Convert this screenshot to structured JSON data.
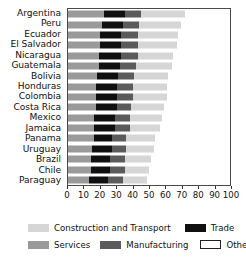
{
  "chart_data": {
    "type": "bar",
    "orientation": "horizontal",
    "stacked": true,
    "title": "",
    "xlabel": "",
    "ylabel": "",
    "xlim": [
      0,
      100
    ],
    "xticks": [
      0,
      10,
      20,
      30,
      40,
      50,
      60,
      70,
      80,
      90,
      100
    ],
    "grid": false,
    "legend_position": "bottom",
    "categories": [
      "Argentina",
      "Peru",
      "Ecuador",
      "El Salvador",
      "Nicaragua",
      "Guatemala",
      "Bolivia",
      "Honduras",
      "Colombia",
      "Costa Rica",
      "Mexico",
      "Jamaica",
      "Panama",
      "Uruguay",
      "Brazil",
      "Chile",
      "Paraguay"
    ],
    "series": [
      {
        "name": "Services",
        "color": "#9a9a9a",
        "values": [
          22,
          21,
          20,
          20,
          19,
          19,
          18,
          17,
          17,
          17,
          16,
          16,
          16,
          15,
          14,
          14,
          13
        ]
      },
      {
        "name": "Trade",
        "color": "#101010",
        "values": [
          13,
          13,
          13,
          13,
          14,
          13,
          13,
          13,
          13,
          13,
          13,
          13,
          11,
          12,
          12,
          12,
          12
        ]
      },
      {
        "name": "Manufacturing",
        "color": "#5b5b5b",
        "values": [
          10,
          10,
          10,
          10,
          10,
          10,
          10,
          10,
          10,
          9,
          9,
          9,
          9,
          9,
          9,
          9,
          9
        ]
      },
      {
        "name": "Construction and Transport",
        "color": "#d6d6d6",
        "values": [
          27,
          26,
          25,
          24,
          22,
          22,
          21,
          21,
          21,
          20,
          20,
          19,
          18,
          17,
          16,
          15,
          15
        ]
      },
      {
        "name": "Others",
        "color": "#ffffff",
        "values": [
          28,
          30,
          32,
          33,
          35,
          36,
          38,
          39,
          39,
          41,
          42,
          43,
          46,
          47,
          49,
          50,
          51
        ]
      }
    ],
    "totals": [
      72,
      70,
      68,
      67,
      65,
      64,
      62,
      61,
      61,
      59,
      58,
      57,
      54,
      53,
      51,
      50,
      49
    ]
  },
  "legend": {
    "items": [
      {
        "label": "Construction and Transport",
        "swatch": "construction"
      },
      {
        "label": "Trade",
        "swatch": "trade"
      },
      {
        "label": "Services",
        "swatch": "services"
      },
      {
        "label": "Manufacturing",
        "swatch": "manufacturing"
      },
      {
        "label": "Others",
        "swatch": "others"
      }
    ]
  }
}
